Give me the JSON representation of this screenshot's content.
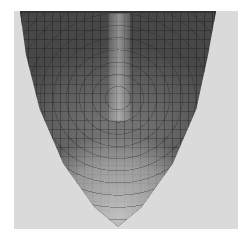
{
  "image": {
    "subject": "Longitudinal section of a plant root tip (micrograph)",
    "colors": {
      "page_background": "#ffffff",
      "frame_background": "#dadada",
      "tissue_dark": "#484848",
      "tissue_mid": "#7a7a7a",
      "cap_light": "#d7d7d7"
    }
  }
}
